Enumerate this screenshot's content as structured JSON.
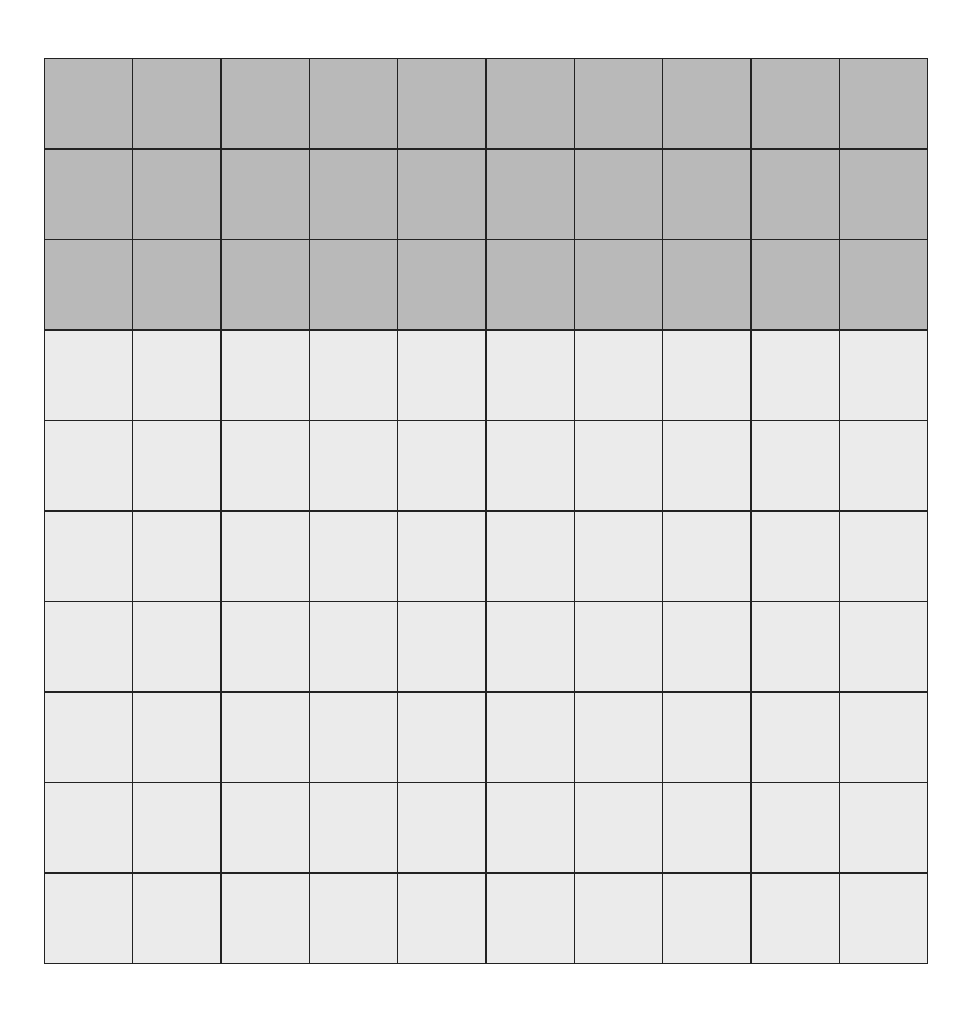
{
  "diagram": {
    "type": "hundred-grid",
    "rows": 10,
    "columns": 10,
    "total_cells": 100,
    "shaded_rows": 3,
    "shaded_cells": 30,
    "unshaded_cells": 70,
    "shaded_fraction": "30/100",
    "colors": {
      "shaded": "#b9b9b9",
      "unshaded": "#ebebeb",
      "gridline": "#222222"
    }
  }
}
